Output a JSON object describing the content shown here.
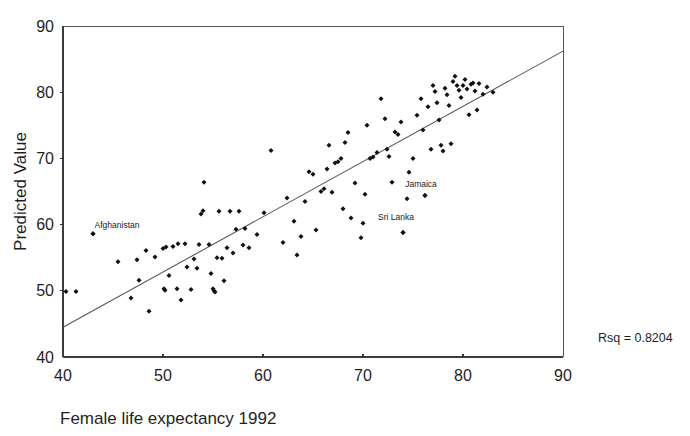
{
  "chart_data": {
    "type": "scatter",
    "title": "",
    "xlabel": "Female life expectancy 1992",
    "ylabel": "Predicted Value",
    "xlim": [
      40,
      90
    ],
    "ylim": [
      40,
      90
    ],
    "xticks": [
      40,
      50,
      60,
      70,
      80,
      90
    ],
    "yticks": [
      40,
      50,
      60,
      70,
      80,
      90
    ],
    "grid": false,
    "legend": "none",
    "annotations": [
      {
        "name": "rsq",
        "text": "Rsq = 0.8204",
        "x": 93.5,
        "y": 42.2
      }
    ],
    "point_labels": [
      {
        "name": "Afghanistan",
        "text": "Afghanistan",
        "label_x": 45.4,
        "label_y": 60.0,
        "point_x": 43.0,
        "point_y": 58.6
      },
      {
        "name": "Jamaica",
        "text": "Jamaica",
        "label_x": 75.8,
        "label_y": 66.1,
        "point_x": 76.2,
        "point_y": 64.4
      },
      {
        "name": "Sri Lanka",
        "text": "Sri Lanka",
        "label_x": 73.3,
        "label_y": 61.2,
        "point_x": 74.0,
        "point_y": 58.8
      }
    ],
    "fit_line": {
      "name": "regression-line",
      "x": [
        40,
        90
      ],
      "y": [
        44.5,
        86.2
      ]
    },
    "series": [
      {
        "name": "Countries",
        "marker": "diamond",
        "color": "#111111",
        "points": [
          [
            40.3,
            49.9
          ],
          [
            41.3,
            49.9
          ],
          [
            43.0,
            58.6
          ],
          [
            45.5,
            54.4
          ],
          [
            46.8,
            48.9
          ],
          [
            47.4,
            54.7
          ],
          [
            47.6,
            51.6
          ],
          [
            48.3,
            56.1
          ],
          [
            48.6,
            46.9
          ],
          [
            49.2,
            55.1
          ],
          [
            50.0,
            56.4
          ],
          [
            50.1,
            50.3
          ],
          [
            50.2,
            50.1
          ],
          [
            50.3,
            56.6
          ],
          [
            50.6,
            52.3
          ],
          [
            51.0,
            56.7
          ],
          [
            51.4,
            50.3
          ],
          [
            51.5,
            57.1
          ],
          [
            51.8,
            48.6
          ],
          [
            52.2,
            57.1
          ],
          [
            52.4,
            53.6
          ],
          [
            52.8,
            50.2
          ],
          [
            53.1,
            54.8
          ],
          [
            53.4,
            53.4
          ],
          [
            53.6,
            57.0
          ],
          [
            53.8,
            61.6
          ],
          [
            54.0,
            62.1
          ],
          [
            54.1,
            66.4
          ],
          [
            54.6,
            57.0
          ],
          [
            54.8,
            52.6
          ],
          [
            55.0,
            50.3
          ],
          [
            55.1,
            50.0
          ],
          [
            55.2,
            49.8
          ],
          [
            55.4,
            55.0
          ],
          [
            55.6,
            62.0
          ],
          [
            55.9,
            54.9
          ],
          [
            56.1,
            51.5
          ],
          [
            56.4,
            56.5
          ],
          [
            56.7,
            62.0
          ],
          [
            57.0,
            55.7
          ],
          [
            57.3,
            59.3
          ],
          [
            57.6,
            62.0
          ],
          [
            58.0,
            56.9
          ],
          [
            58.2,
            59.4
          ],
          [
            58.6,
            56.5
          ],
          [
            59.4,
            58.5
          ],
          [
            60.1,
            61.8
          ],
          [
            60.8,
            71.2
          ],
          [
            62.0,
            57.3
          ],
          [
            62.4,
            64.0
          ],
          [
            63.1,
            60.5
          ],
          [
            63.4,
            55.4
          ],
          [
            63.8,
            58.2
          ],
          [
            64.2,
            63.5
          ],
          [
            64.6,
            68.0
          ],
          [
            65.0,
            67.6
          ],
          [
            65.3,
            59.2
          ],
          [
            65.8,
            65.0
          ],
          [
            66.1,
            65.4
          ],
          [
            66.4,
            68.4
          ],
          [
            66.6,
            72.0
          ],
          [
            66.9,
            64.9
          ],
          [
            67.2,
            69.3
          ],
          [
            67.5,
            69.5
          ],
          [
            67.8,
            70.0
          ],
          [
            68.0,
            62.4
          ],
          [
            68.2,
            72.4
          ],
          [
            68.5,
            73.9
          ],
          [
            68.8,
            61.0
          ],
          [
            69.2,
            66.3
          ],
          [
            69.8,
            58.0
          ],
          [
            70.0,
            60.2
          ],
          [
            70.2,
            64.6
          ],
          [
            70.4,
            75.0
          ],
          [
            70.7,
            70.0
          ],
          [
            71.0,
            70.2
          ],
          [
            71.4,
            70.9
          ],
          [
            71.8,
            79.0
          ],
          [
            72.2,
            76.0
          ],
          [
            72.4,
            71.4
          ],
          [
            72.6,
            70.3
          ],
          [
            72.9,
            66.4
          ],
          [
            73.2,
            74.0
          ],
          [
            73.5,
            73.6
          ],
          [
            73.8,
            75.5
          ],
          [
            74.0,
            58.8
          ],
          [
            74.4,
            63.9
          ],
          [
            74.6,
            67.9
          ],
          [
            75.0,
            70.0
          ],
          [
            75.4,
            76.5
          ],
          [
            75.8,
            79.0
          ],
          [
            76.0,
            74.3
          ],
          [
            76.2,
            64.4
          ],
          [
            76.5,
            77.8
          ],
          [
            76.8,
            71.4
          ],
          [
            77.0,
            81.0
          ],
          [
            77.2,
            80.1
          ],
          [
            77.4,
            78.4
          ],
          [
            77.6,
            75.8
          ],
          [
            77.8,
            72.0
          ],
          [
            78.0,
            71.1
          ],
          [
            78.2,
            80.6
          ],
          [
            78.4,
            79.6
          ],
          [
            78.6,
            78.0
          ],
          [
            78.8,
            72.2
          ],
          [
            79.0,
            81.6
          ],
          [
            79.2,
            82.4
          ],
          [
            79.4,
            81.0
          ],
          [
            79.6,
            80.3
          ],
          [
            79.8,
            79.2
          ],
          [
            80.0,
            81.0
          ],
          [
            80.2,
            81.9
          ],
          [
            80.4,
            80.5
          ],
          [
            80.6,
            76.6
          ],
          [
            80.8,
            81.2
          ],
          [
            81.0,
            81.4
          ],
          [
            81.2,
            80.2
          ],
          [
            81.4,
            77.3
          ],
          [
            81.6,
            81.3
          ],
          [
            82.0,
            79.7
          ],
          [
            82.4,
            80.8
          ],
          [
            83.0,
            80.0
          ]
        ]
      }
    ]
  },
  "figure": {
    "y_axis_title": "Predicted Value",
    "x_axis_title": "Female life expectancy 1992",
    "rsq_label": "Rsq = 0.8204"
  }
}
